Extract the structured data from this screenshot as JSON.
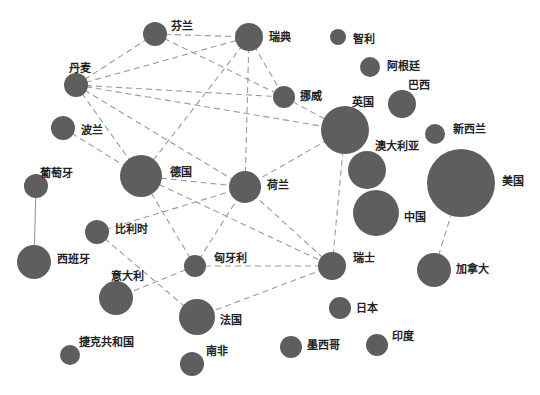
{
  "diagram": {
    "type": "network",
    "node_color": "#5e5e5e",
    "edge_color": "#9a9a9a",
    "nodes": [
      {
        "id": "finland",
        "label": "芬兰",
        "x": 155,
        "y": 34,
        "r": 12,
        "lx": 171,
        "ly": 26
      },
      {
        "id": "sweden",
        "label": "瑞典",
        "x": 249,
        "y": 37,
        "r": 14,
        "lx": 269,
        "ly": 37
      },
      {
        "id": "chile",
        "label": "智利",
        "x": 338,
        "y": 37,
        "r": 8,
        "lx": 353,
        "ly": 39
      },
      {
        "id": "denmark",
        "label": "丹麦",
        "x": 76,
        "y": 85,
        "r": 12,
        "lx": 69,
        "ly": 68
      },
      {
        "id": "argentina",
        "label": "阿根廷",
        "x": 370,
        "y": 67,
        "r": 10,
        "lx": 387,
        "ly": 66
      },
      {
        "id": "norway",
        "label": "挪威",
        "x": 284,
        "y": 97,
        "r": 11,
        "lx": 300,
        "ly": 96
      },
      {
        "id": "brazil",
        "label": "巴西",
        "x": 402,
        "y": 104,
        "r": 14,
        "lx": 408,
        "ly": 85
      },
      {
        "id": "uk",
        "label": "英国",
        "x": 345,
        "y": 130,
        "r": 24,
        "lx": 352,
        "ly": 102
      },
      {
        "id": "poland",
        "label": "波兰",
        "x": 63,
        "y": 128,
        "r": 12,
        "lx": 81,
        "ly": 130
      },
      {
        "id": "newzealand",
        "label": "新西兰",
        "x": 435,
        "y": 134,
        "r": 10,
        "lx": 453,
        "ly": 129
      },
      {
        "id": "australia",
        "label": "澳大利亚",
        "x": 367,
        "y": 170,
        "r": 19,
        "lx": 375,
        "ly": 146
      },
      {
        "id": "usa",
        "label": "美国",
        "x": 461,
        "y": 183,
        "r": 34,
        "lx": 502,
        "ly": 181
      },
      {
        "id": "germany",
        "label": "德国",
        "x": 141,
        "y": 176,
        "r": 21,
        "lx": 170,
        "ly": 172
      },
      {
        "id": "netherlands",
        "label": "荷兰",
        "x": 245,
        "y": 187,
        "r": 16,
        "lx": 267,
        "ly": 185
      },
      {
        "id": "portugal",
        "label": "葡萄牙",
        "x": 36,
        "y": 186,
        "r": 12,
        "lx": 40,
        "ly": 173
      },
      {
        "id": "china",
        "label": "中国",
        "x": 376,
        "y": 213,
        "r": 23,
        "lx": 404,
        "ly": 217
      },
      {
        "id": "belgium",
        "label": "比利时",
        "x": 97,
        "y": 232,
        "r": 12,
        "lx": 115,
        "ly": 229
      },
      {
        "id": "spain",
        "label": "西班牙",
        "x": 34,
        "y": 262,
        "r": 17,
        "lx": 57,
        "ly": 259
      },
      {
        "id": "switzerland",
        "label": "瑞士",
        "x": 332,
        "y": 266,
        "r": 14,
        "lx": 353,
        "ly": 258
      },
      {
        "id": "canada",
        "label": "加拿大",
        "x": 434,
        "y": 270,
        "r": 17,
        "lx": 456,
        "ly": 269
      },
      {
        "id": "hungary",
        "label": "匈牙利",
        "x": 195,
        "y": 266,
        "r": 11,
        "lx": 214,
        "ly": 258
      },
      {
        "id": "italy",
        "label": "意大利",
        "x": 116,
        "y": 298,
        "r": 17,
        "lx": 111,
        "ly": 276
      },
      {
        "id": "japan",
        "label": "日本",
        "x": 340,
        "y": 308,
        "r": 11,
        "lx": 356,
        "ly": 308
      },
      {
        "id": "france",
        "label": "法国",
        "x": 197,
        "y": 317,
        "r": 18,
        "lx": 220,
        "ly": 320
      },
      {
        "id": "czech",
        "label": "捷克共和国",
        "x": 70,
        "y": 355,
        "r": 10,
        "lx": 79,
        "ly": 342
      },
      {
        "id": "southafrica",
        "label": "南非",
        "x": 192,
        "y": 364,
        "r": 12,
        "lx": 206,
        "ly": 351
      },
      {
        "id": "mexico",
        "label": "墨西哥",
        "x": 291,
        "y": 347,
        "r": 11,
        "lx": 307,
        "ly": 345
      },
      {
        "id": "india",
        "label": "印度",
        "x": 377,
        "y": 345,
        "r": 11,
        "lx": 392,
        "ly": 336
      }
    ],
    "edges": [
      {
        "from": "denmark",
        "to": "finland",
        "style": "dashed"
      },
      {
        "from": "denmark",
        "to": "sweden",
        "style": "dashed"
      },
      {
        "from": "denmark",
        "to": "norway",
        "style": "dashed"
      },
      {
        "from": "denmark",
        "to": "uk",
        "style": "dashed"
      },
      {
        "from": "denmark",
        "to": "germany",
        "style": "dashed"
      },
      {
        "from": "denmark",
        "to": "netherlands",
        "style": "dashed"
      },
      {
        "from": "finland",
        "to": "sweden",
        "style": "dashed"
      },
      {
        "from": "finland",
        "to": "norway",
        "style": "dashed"
      },
      {
        "from": "sweden",
        "to": "norway",
        "style": "dashed"
      },
      {
        "from": "sweden",
        "to": "germany",
        "style": "dashed"
      },
      {
        "from": "sweden",
        "to": "netherlands",
        "style": "dashed"
      },
      {
        "from": "norway",
        "to": "uk",
        "style": "dashed"
      },
      {
        "from": "poland",
        "to": "germany",
        "style": "dashed"
      },
      {
        "from": "germany",
        "to": "netherlands",
        "style": "dashed"
      },
      {
        "from": "germany",
        "to": "switzerland",
        "style": "dashed"
      },
      {
        "from": "germany",
        "to": "hungary",
        "style": "dashed"
      },
      {
        "from": "netherlands",
        "to": "uk",
        "style": "dashed"
      },
      {
        "from": "netherlands",
        "to": "belgium",
        "style": "dashed"
      },
      {
        "from": "netherlands",
        "to": "hungary",
        "style": "dashed"
      },
      {
        "from": "netherlands",
        "to": "switzerland",
        "style": "dashed"
      },
      {
        "from": "uk",
        "to": "switzerland",
        "style": "dashed"
      },
      {
        "from": "hungary",
        "to": "switzerland",
        "style": "dashed"
      },
      {
        "from": "hungary",
        "to": "italy",
        "style": "dashed"
      },
      {
        "from": "belgium",
        "to": "france",
        "style": "dashed"
      },
      {
        "from": "france",
        "to": "switzerland",
        "style": "dashed"
      },
      {
        "from": "usa",
        "to": "canada",
        "style": "dashed"
      },
      {
        "from": "portugal",
        "to": "spain",
        "style": "solid"
      }
    ]
  }
}
